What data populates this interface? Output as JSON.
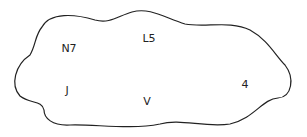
{
  "diagram": {
    "type": "set-blob",
    "outline_color": "#222222",
    "background": "#ffffff",
    "elements": [
      {
        "label": "N7",
        "x": 69,
        "y": 48
      },
      {
        "label": "L5",
        "x": 149,
        "y": 38
      },
      {
        "label": "J",
        "x": 67,
        "y": 90
      },
      {
        "label": "V",
        "x": 147,
        "y": 101
      },
      {
        "label": "4",
        "x": 245,
        "y": 84
      }
    ]
  }
}
